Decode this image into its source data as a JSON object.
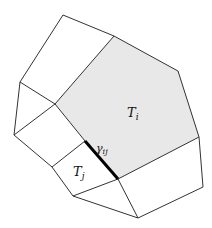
{
  "diagram": {
    "colors": {
      "stroke": "#333333",
      "shaded_fill": "#e8e8e8",
      "shared_edge": "#000000",
      "background": "#ffffff"
    },
    "cells": [
      {
        "id": "T_i",
        "label": "T",
        "subscript": "i",
        "shaded": true
      },
      {
        "id": "T_j",
        "label": "T",
        "subscript": "j",
        "shaded": false
      }
    ],
    "shared_edge": {
      "label": "γ",
      "subscript": "ij"
    }
  }
}
